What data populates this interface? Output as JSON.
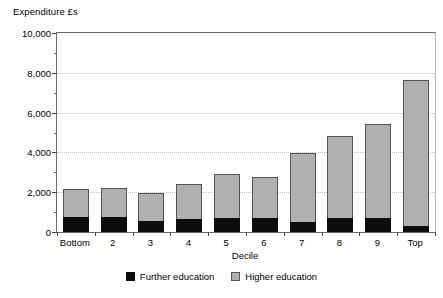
{
  "chart_data": {
    "type": "bar",
    "subtype": "stacked-vertical",
    "title": "",
    "ylabel": "Expenditure £s",
    "xlabel": "Decile",
    "ylim": [
      0,
      10000
    ],
    "ytick_values": [
      0,
      2000,
      4000,
      6000,
      8000,
      10000
    ],
    "ytick_labels": [
      "0",
      "2,000",
      "4,000",
      "6,000",
      "8,000",
      "10,000"
    ],
    "yminor_tick_values": [
      1000,
      3000,
      5000,
      7000,
      9000
    ],
    "grid": "horizontal-dotted",
    "legend_position": "bottom-center",
    "categories": [
      "Bottom",
      "2",
      "3",
      "4",
      "5",
      "6",
      "7",
      "8",
      "9",
      "Top"
    ],
    "series": [
      {
        "name": "Further education",
        "color": "#0d0d0d",
        "values": [
          750,
          750,
          530,
          660,
          710,
          710,
          490,
          710,
          680,
          310
        ]
      },
      {
        "name": "Higher education",
        "color": "#b0b0b0",
        "values": [
          1400,
          1450,
          1450,
          1760,
          2190,
          2040,
          3460,
          4140,
          4770,
          7340
        ]
      }
    ],
    "totals": [
      2150,
      2200,
      1980,
      2420,
      2900,
      2750,
      3950,
      4850,
      5450,
      7650
    ]
  },
  "axes": {
    "y_title": "Expenditure £s",
    "x_title": "Decile"
  },
  "legend": {
    "items": [
      {
        "label": "Further education",
        "swatch": "black-square-icon"
      },
      {
        "label": "Higher education",
        "swatch": "grey-square-icon"
      }
    ]
  },
  "colors": {
    "further_education": "#0d0d0d",
    "higher_education": "#b0b0b0",
    "bar_outline": "#555555",
    "axis": "#4a4a4a",
    "gridline": "#c3c3c3",
    "background": "#ffffff"
  }
}
